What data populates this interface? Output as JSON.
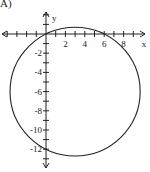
{
  "option_label": "A)",
  "chart_data": {
    "type": "line",
    "title": "",
    "xlabel": "x",
    "ylabel": "y",
    "xlim": [
      -5,
      10
    ],
    "ylim": [
      -14,
      3
    ],
    "grid": false,
    "x_tick_labels": [
      "2",
      "4",
      "6",
      "8"
    ],
    "x_ticks": [
      2,
      4,
      6,
      8
    ],
    "y_tick_labels": [
      "-2",
      "-4",
      "-6",
      "-8",
      "-10",
      "-12"
    ],
    "y_ticks": [
      -2,
      -4,
      -6,
      -8,
      -10,
      -12
    ],
    "series": [
      {
        "name": "circle",
        "shape": "circle",
        "center": [
          3,
          -6
        ],
        "radius": 6.708,
        "equation": "(x-3)^2 + (y+6)^2 = 45",
        "passes_through": [
          [
            0,
            0
          ],
          [
            6,
            0
          ],
          [
            0,
            -12
          ],
          [
            6,
            -12
          ]
        ]
      }
    ]
  }
}
